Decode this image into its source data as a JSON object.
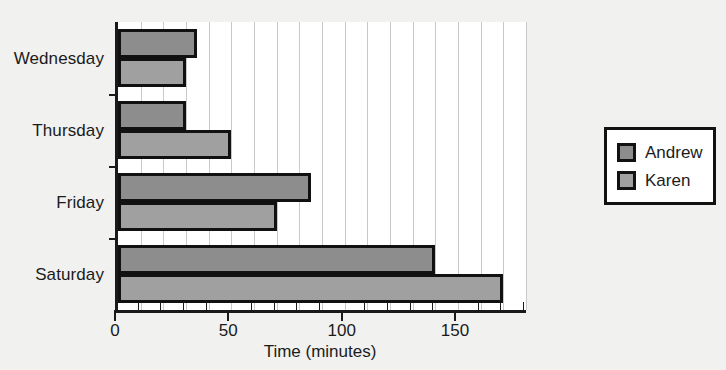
{
  "chart_data": {
    "type": "bar",
    "orientation": "horizontal",
    "title": "",
    "xlabel": "Time (minutes)",
    "ylabel": "",
    "categories": [
      "Wednesday",
      "Thursday",
      "Friday",
      "Saturday"
    ],
    "series": [
      {
        "name": "Andrew",
        "color": "#8d8d8d",
        "values": [
          35,
          30,
          85,
          140
        ]
      },
      {
        "name": "Karen",
        "color": "#a0a0a0",
        "values": [
          30,
          50,
          70,
          170
        ]
      }
    ],
    "xlim": [
      0,
      180
    ],
    "xticks": [
      0,
      50,
      100,
      150
    ],
    "xtick_labels": [
      "0",
      "50",
      "100",
      "150"
    ],
    "minor_tick_step": 10,
    "grid": true,
    "grid_axis": "x",
    "grid_step": 10,
    "legend_position": "right",
    "legend_entries": [
      "Andrew",
      "Karen"
    ],
    "background_color": "#f1f1ef",
    "plot_background_color": "#ffffff",
    "axis_color": "#1a1a1a",
    "gridline_color": "#c9c9c9",
    "bar_edge_color": "#111111"
  }
}
